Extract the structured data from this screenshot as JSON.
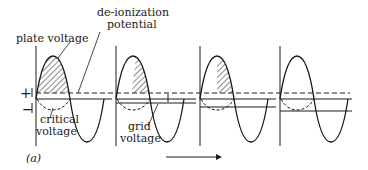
{
  "figure": {
    "panel_label": "(a)",
    "labels": {
      "plate_voltage": "plate voltage",
      "deionization_line1": "de-ionization",
      "deionization_line2": "potential",
      "critical_line1": "critical",
      "critical_line2": "voltage",
      "grid_line1": "grid",
      "grid_line2": "voltage",
      "plus": "+",
      "minus": "−"
    },
    "panels": [
      {
        "index": 1,
        "shaded": "full",
        "grid_offset": 0
      },
      {
        "index": 2,
        "shaded": "partial",
        "grid_offset": 2
      },
      {
        "index": 3,
        "shaded": "late",
        "grid_offset": 8
      },
      {
        "index": 4,
        "shaded": "none",
        "grid_offset": 12
      }
    ],
    "colors": {
      "ink": "#1a1a1a",
      "background": "#ffffff"
    }
  }
}
